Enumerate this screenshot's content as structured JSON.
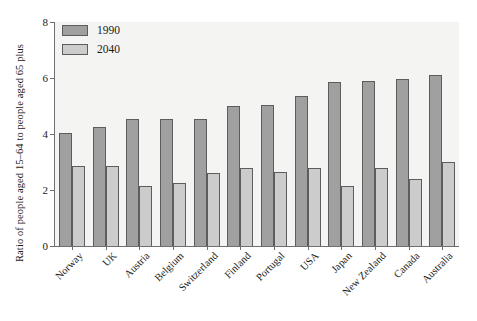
{
  "chart_data": {
    "type": "bar",
    "title": "",
    "subtitle": "",
    "xlabel": "",
    "ylabel": "Ratio of people aged 15–64 to people aged 65 plus",
    "ylim": [
      0,
      8
    ],
    "yticks": [
      0,
      2,
      4,
      6,
      8
    ],
    "ytick_labels": [
      "0",
      "2",
      "4",
      "6",
      "8"
    ],
    "grid": false,
    "legend_position": "top-left",
    "categories": [
      "Norway",
      "UK",
      "Austria",
      "Belgium",
      "Switzerland",
      "Finland",
      "Portugal",
      "USA",
      "Japan",
      "New Zealand",
      "Canada",
      "Australia"
    ],
    "series": [
      {
        "name": "1990",
        "color": "#a0a0a0",
        "values": [
          4.05,
          4.25,
          4.55,
          4.55,
          4.55,
          5.0,
          5.05,
          5.35,
          5.85,
          5.9,
          5.95,
          6.1
        ]
      },
      {
        "name": "2040",
        "color": "#cccccc",
        "values": [
          2.85,
          2.85,
          2.15,
          2.25,
          2.6,
          2.8,
          2.65,
          2.8,
          2.15,
          2.8,
          2.4,
          3.0
        ]
      }
    ]
  },
  "legend": {
    "items": [
      {
        "label": "1990",
        "swatch": "series-1990-swatch"
      },
      {
        "label": "2040",
        "swatch": "series-2040-swatch"
      }
    ]
  },
  "axes": {
    "y_axis_title": "Ratio of people aged 15–64 to people aged 65 plus",
    "y_tick_labels": [
      "0",
      "2",
      "4",
      "6",
      "8"
    ],
    "x_tick_labels": [
      "Norway",
      "UK",
      "Austria",
      "Belgium",
      "Switzerland",
      "Finland",
      "Portugal",
      "USA",
      "Japan",
      "New Zealand",
      "Canada",
      "Australia"
    ]
  },
  "colors": {
    "series_1990": "#a0a0a0",
    "series_2040": "#cccccc",
    "bar_outline": "#5d5d5d",
    "axis": "#6f6f6f",
    "plot_background": "#f4f4f3",
    "page_background": "#ffffff",
    "text": "#1a1a1a"
  }
}
